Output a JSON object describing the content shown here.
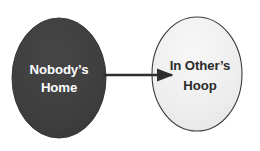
{
  "diagram": {
    "type": "flow-diagram",
    "background_color": "#ffffff",
    "nodes": [
      {
        "id": "source",
        "shape": "ellipse",
        "label_line1": "Nobody’s",
        "label_line2": "Home",
        "fill_color": "#3f3f3f",
        "stroke_color": "#3f3f3f",
        "text_color": "#ffffff",
        "cx": 59,
        "cy": 78,
        "rx": 47,
        "ry": 60
      },
      {
        "id": "target",
        "shape": "ellipse",
        "label_line1": "In Other’s",
        "label_line2": "Hoop",
        "fill_color": "#efefef",
        "stroke_color": "#3a3a3a",
        "text_color": "#2b2b2b",
        "cx": 197,
        "cy": 74,
        "rx": 45,
        "ry": 57
      }
    ],
    "edges": [
      {
        "id": "source-to-target",
        "from": "source",
        "to": "target",
        "style": "solid-arrow",
        "color": "#2e2e2e",
        "x1": 103,
        "y1": 75,
        "x2": 177,
        "y2": 75
      }
    ]
  }
}
